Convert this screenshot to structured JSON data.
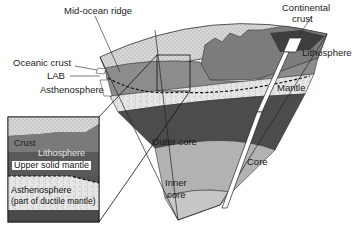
{
  "diagram": {
    "labels": {
      "mid_ocean_ridge": "Mid-ocean ridge",
      "continental_crust_line1": "Continental",
      "continental_crust_line2": "crust",
      "oceanic_crust": "Oceanic crust",
      "lab": "LAB",
      "asthenosphere": "Asthenosphere",
      "lithosphere": "Lithosphere",
      "mantle": "Mantle",
      "core": "Core",
      "outer_core": "Outer core",
      "inner_core_line1": "Inner",
      "inner_core_line2": "core"
    },
    "inset": {
      "crust": "Crust",
      "lithosphere": "Lithosphere",
      "upper_solid_mantle": "Upper solid mantle",
      "asthenosphere": "Asthenosphere",
      "ductile_note": "(part of ductile mantle)"
    },
    "colors": {
      "ocean_dots": "#d6d6d6",
      "crust": "#8a8a8a",
      "lithosphere_mantle": "#9a9a9a",
      "asthenosphere": "#e4e4e4",
      "lower_mantle": "#4a4a4a",
      "outer_core": "#b4b4b4",
      "inner_core": "#c4c4c4",
      "continent": "#7a7a7a"
    }
  }
}
